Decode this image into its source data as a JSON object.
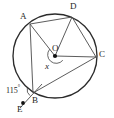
{
  "figure": {
    "type": "circle-geometry-diagram",
    "stroke_color": "#3a3a3a",
    "circle_color": "#2b2b2b",
    "background": "#ffffff",
    "circle": {
      "cx": 55,
      "cy": 56,
      "r": 42
    },
    "center_point": {
      "name": "O",
      "x": 55,
      "y": 56,
      "dot": true
    },
    "points": [
      {
        "name": "A",
        "x": 30,
        "y": 24,
        "on_circle": true,
        "label_x": 20,
        "label_y": 14
      },
      {
        "name": "D",
        "x": 72,
        "y": 17,
        "on_circle": true,
        "label_x": 71,
        "label_y": 4
      },
      {
        "name": "C",
        "x": 96,
        "y": 57,
        "on_circle": true,
        "label_x": 98,
        "label_y": 52
      },
      {
        "name": "B",
        "x": 33,
        "y": 93,
        "on_circle": true,
        "label_x": 33,
        "label_y": 99
      },
      {
        "name": "E",
        "x": 23,
        "y": 104,
        "on_circle": false,
        "dot": true,
        "label_x": 18,
        "label_y": 106
      }
    ],
    "segments": [
      {
        "from": "A",
        "to": "D",
        "kind": "chord"
      },
      {
        "from": "D",
        "to": "C",
        "kind": "chord"
      },
      {
        "from": "A",
        "to": "B",
        "kind": "chord"
      },
      {
        "from": "B",
        "to": "C",
        "kind": "chord"
      },
      {
        "from": "O",
        "to": "A",
        "kind": "radius"
      },
      {
        "from": "O",
        "to": "C",
        "kind": "radius"
      },
      {
        "from": "O",
        "to": "D",
        "kind": "radius"
      },
      {
        "from": "E",
        "to": "B",
        "kind": "external-line"
      }
    ],
    "angles": [
      {
        "vertex": "O",
        "label": "x",
        "label_x": 46,
        "label_y": 61,
        "arc_marked": true,
        "italic": true
      },
      {
        "vertex": "B",
        "label": "115",
        "degree_symbol": "°",
        "label_x": 8,
        "label_y": 86,
        "arc_marked": true,
        "italic": false
      }
    ]
  }
}
